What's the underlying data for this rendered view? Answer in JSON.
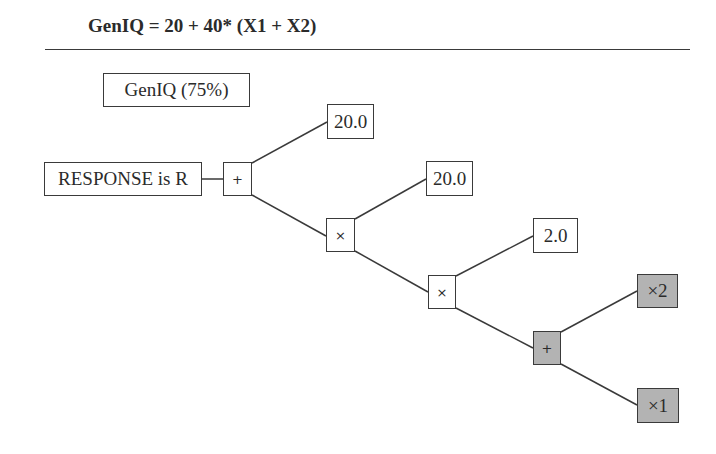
{
  "title": "GenIQ = 20 + 40* (X1 + X2)",
  "colors": {
    "line": "#3a3a3a",
    "box_fill": "#ffffff",
    "shaded_fill": "#b3b3b3",
    "text": "#2b2b2b"
  },
  "diagram": {
    "type": "expression-tree",
    "legend_box": {
      "label": "GenIQ (75%)"
    },
    "root_label": {
      "label": "RESPONSE is R"
    },
    "nodes": [
      {
        "id": "plus1",
        "label": "+",
        "kind": "operator",
        "shaded": false
      },
      {
        "id": "const1",
        "label": "20.0",
        "kind": "constant",
        "shaded": false
      },
      {
        "id": "times1",
        "label": "×",
        "kind": "operator",
        "shaded": false
      },
      {
        "id": "const2",
        "label": "20.0",
        "kind": "constant",
        "shaded": false
      },
      {
        "id": "times2",
        "label": "×",
        "kind": "operator",
        "shaded": false
      },
      {
        "id": "const3",
        "label": "2.0",
        "kind": "constant",
        "shaded": false
      },
      {
        "id": "plus2",
        "label": "+",
        "kind": "operator",
        "shaded": true
      },
      {
        "id": "var2",
        "label": "×2",
        "kind": "variable",
        "shaded": true
      },
      {
        "id": "var1",
        "label": "×1",
        "kind": "variable",
        "shaded": true
      }
    ],
    "edges": [
      [
        "root",
        "plus1"
      ],
      [
        "plus1",
        "const1"
      ],
      [
        "plus1",
        "times1"
      ],
      [
        "times1",
        "const2"
      ],
      [
        "times1",
        "times2"
      ],
      [
        "times2",
        "const3"
      ],
      [
        "times2",
        "plus2"
      ],
      [
        "plus2",
        "var2"
      ],
      [
        "plus2",
        "var1"
      ]
    ]
  }
}
